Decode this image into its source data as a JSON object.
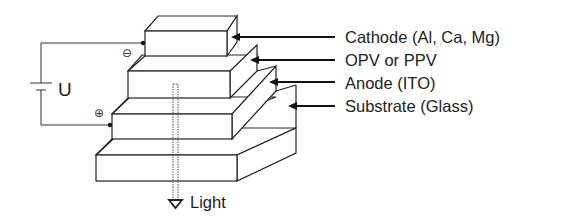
{
  "diagram": {
    "layers": [
      {
        "id": "cathode",
        "label": "Cathode (Al, Ca, Mg)"
      },
      {
        "id": "opv",
        "label": "OPV or PPV"
      },
      {
        "id": "anode",
        "label": "Anode (ITO)"
      },
      {
        "id": "substrate",
        "label": "Substrate (Glass)"
      }
    ],
    "circuit": {
      "voltage_label": "U",
      "negative_symbol": "⊖",
      "positive_symbol": "⊕"
    },
    "emission": {
      "label": "Light",
      "arrow_symbol": "▽"
    },
    "colors": {
      "line": "#222222",
      "background": "#ffffff"
    }
  }
}
